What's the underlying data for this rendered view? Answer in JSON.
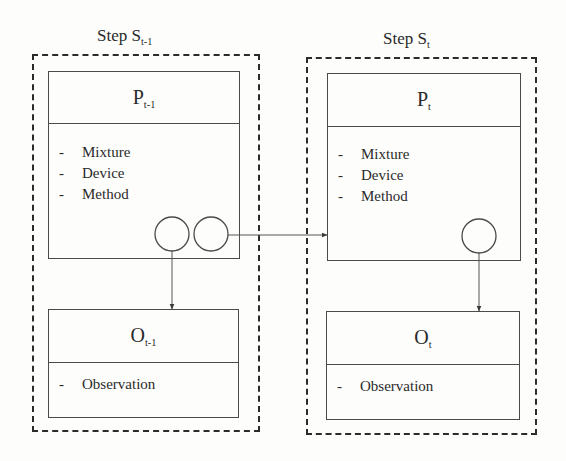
{
  "diagram": {
    "steps": [
      {
        "id": "prev",
        "title": {
          "prefix": "Step S",
          "subscript": "t-1"
        },
        "process": {
          "label": {
            "main": "P",
            "subscript": "t-1"
          },
          "items": [
            "Mixture",
            "Device",
            "Method"
          ],
          "ports": 2
        },
        "observation": {
          "label": {
            "main": "O",
            "subscript": "t-1"
          },
          "items": [
            "Observation"
          ]
        }
      },
      {
        "id": "curr",
        "title": {
          "prefix": "Step S",
          "subscript": "t"
        },
        "process": {
          "label": {
            "main": "P",
            "subscript": "t"
          },
          "items": [
            "Mixture",
            "Device",
            "Method"
          ],
          "ports": 1
        },
        "observation": {
          "label": {
            "main": "O",
            "subscript": "t"
          },
          "items": [
            "Observation"
          ]
        }
      }
    ],
    "bullet": "-",
    "edges": [
      {
        "from": "P_t-1.port1",
        "to": "O_t-1",
        "style": "arrow"
      },
      {
        "from": "P_t-1.port2",
        "to": "P_t",
        "style": "arrow"
      },
      {
        "from": "P_t.port1",
        "to": "O_t",
        "style": "arrow"
      }
    ],
    "colors": {
      "line": "#4a4a4a",
      "dashed": "#2b2b2b",
      "text": "#2a2a2a",
      "background": "#fdfdfc"
    }
  }
}
